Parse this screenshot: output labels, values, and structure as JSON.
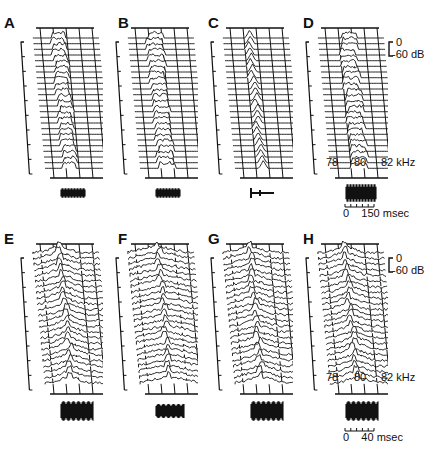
{
  "figure": {
    "rows": [
      {
        "panels": [
          {
            "label": "A",
            "x": 18,
            "y": 32,
            "peak": 0.38,
            "spread": 0.1,
            "type": "band"
          },
          {
            "label": "B",
            "x": 113,
            "y": 32,
            "peak": 0.4,
            "spread": 0.12,
            "type": "band"
          },
          {
            "label": "C",
            "x": 208,
            "y": 32,
            "peak": 0.4,
            "spread": 0.02,
            "type": "narrow"
          },
          {
            "label": "D",
            "x": 303,
            "y": 32,
            "peak": 0.45,
            "spread": 0.12,
            "type": "band"
          }
        ],
        "freq_axis": {
          "ticks": [
            "78",
            "80",
            "82 kHz"
          ]
        },
        "time_axis": {
          "label": "0    150 msec"
        }
      },
      {
        "panels": [
          {
            "label": "E",
            "x": 18,
            "y": 248,
            "peak": 0.4,
            "spread": 0.05,
            "type": "broad"
          },
          {
            "label": "F",
            "x": 113,
            "y": 248,
            "peak": 0.45,
            "spread": 0.18,
            "type": "broad"
          },
          {
            "label": "G",
            "x": 208,
            "y": 248,
            "peak": 0.4,
            "spread": 0.1,
            "type": "broad"
          },
          {
            "label": "H",
            "x": 303,
            "y": 248,
            "peak": 0.4,
            "spread": 0.05,
            "type": "broad"
          }
        ],
        "freq_axis": {
          "ticks": [
            "78",
            "80",
            "82 kHz"
          ]
        },
        "time_axis": {
          "label": "0    40 msec"
        }
      }
    ],
    "amplitude_scale": {
      "top": "0",
      "bottom": "-60 dB"
    },
    "colors": {
      "ink": "#111111",
      "background": "#ffffff"
    }
  }
}
